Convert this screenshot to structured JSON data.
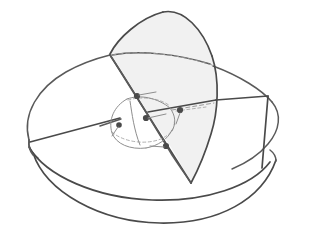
{
  "figure": {
    "caption": "",
    "background_color": "#ffffff",
    "ink_color": "#5a5a5a",
    "dark_ink_color": "#4a4a4a",
    "faint_ink_color": "#9a9a9a",
    "shade_fill_color": "#f1f1f1",
    "vertex_color": "#4a4a4a"
  },
  "parts": {
    "outer_rim": {
      "name": "outer ellipse rim",
      "description": "large ellipse forming the open top of the bowl"
    },
    "bowl": {
      "name": "hemispherical bowl",
      "description": "lower hemisphere drawn with two nested arcs"
    },
    "petal": {
      "name": "shaded spherical lune",
      "description": "shaded petal shaped region rising from the centre",
      "fill": "#f1f1f1"
    },
    "inner_sphere": {
      "name": "inner small sphere",
      "description": "small sphere at the centre with dashed hidden equator"
    },
    "axis_lines": {
      "name": "great circle chords",
      "description": "straight chords crossing the disk through the centre"
    },
    "hidden_edges": {
      "name": "hidden dashed edges",
      "description": "dashed curves indicating edges behind the surface"
    },
    "vertices": {
      "name": "marked vertex points",
      "count": 5
    }
  },
  "labels": {
    "items": []
  }
}
